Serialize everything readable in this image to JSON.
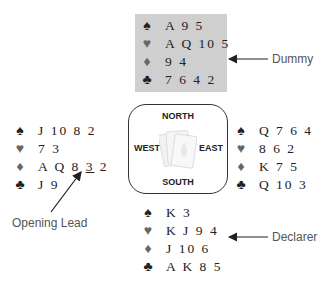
{
  "hands": {
    "north": {
      "role": "Dummy",
      "spades": "A 9 5",
      "hearts": "A Q 10 5",
      "diamonds": "9 4",
      "clubs": "7 6 4 2"
    },
    "west": {
      "spades": "J 10 8 2",
      "hearts": "7 3",
      "diamonds_pre": "A Q 8 ",
      "diamonds_lead": "3",
      "diamonds_post": " 2",
      "clubs": "J 9"
    },
    "east": {
      "spades": "Q 7 6 4",
      "hearts": "8 6 2",
      "diamonds": "K 7 5",
      "clubs": "Q 10 3"
    },
    "south": {
      "role": "Declarer",
      "spades": "K 3",
      "hearts": "K J 9 4",
      "diamonds": "J 10 6",
      "clubs": "A K 8 5"
    }
  },
  "suits": {
    "spades": "♠",
    "hearts": "♥",
    "diamonds": "♦",
    "clubs": "♣"
  },
  "compass": {
    "north": "NORTH",
    "south": "SOUTH",
    "east": "EAST",
    "west": "WEST"
  },
  "labels": {
    "dummy": "Dummy",
    "declarer": "Declarer",
    "opening_lead": "Opening Lead"
  },
  "colors": {
    "dummy_bg": "#cfcfcf",
    "red_suit": "#666666",
    "black_suit": "#222222"
  }
}
